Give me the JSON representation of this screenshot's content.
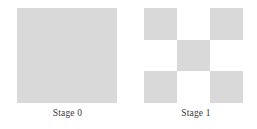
{
  "figure": {
    "background_color": "#ffffff",
    "fill_color": "#d9d9d9",
    "empty_color": "#ffffff",
    "text_color": "#3a3a3a",
    "stages": [
      {
        "caption": "Stage 0",
        "type": "solid-square",
        "grid_size": 1,
        "filled_count": 1,
        "cells": [
          [
            1
          ]
        ]
      },
      {
        "caption": "Stage 1",
        "type": "grid",
        "grid_size": 3,
        "filled_count": 5,
        "cells": [
          [
            1,
            0,
            1
          ],
          [
            0,
            1,
            0
          ],
          [
            1,
            0,
            1
          ]
        ]
      }
    ]
  },
  "chart_data": {
    "type": "diagram",
    "title": "",
    "categories": [
      "Stage 0",
      "Stage 1"
    ],
    "values": [
      1,
      5
    ],
    "xlabel": "",
    "ylabel": ""
  }
}
